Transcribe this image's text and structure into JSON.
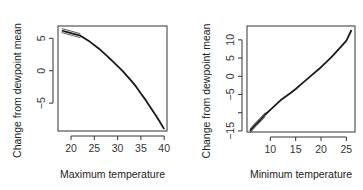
{
  "chart_data": [
    {
      "type": "line",
      "title": "",
      "xlabel": "Maximum temperature",
      "ylabel": "Change from dewpoint mean",
      "xlim": [
        17.2,
        40.6
      ],
      "ylim": [
        -9.3,
        6.9
      ],
      "xticks": [
        20,
        25,
        30,
        35,
        40
      ],
      "yticks": [
        5,
        0,
        -5
      ],
      "grid": false,
      "legend": null,
      "series": [
        {
          "name": "fit",
          "x": [
            18,
            19,
            20,
            22,
            24,
            26,
            28,
            29,
            30,
            31,
            32,
            33,
            34,
            35,
            36,
            37,
            38,
            39,
            40
          ],
          "y": [
            6.2,
            6.0,
            5.8,
            5.4,
            4.5,
            3.4,
            2.1,
            1.4,
            0.7,
            0.0,
            -0.8,
            -1.6,
            -2.5,
            -3.5,
            -4.5,
            -5.6,
            -6.7,
            -7.8,
            -9.0
          ]
        }
      ],
      "box": {
        "left": 58,
        "top": 26,
        "right": 167,
        "bottom": 131
      }
    },
    {
      "type": "line",
      "title": "",
      "xlabel": "Minimum temperature",
      "ylabel": "Change from dewpoint mean",
      "xlim": [
        5.4,
        26.7
      ],
      "ylim": [
        -15.3,
        13.8
      ],
      "xticks": [
        10,
        15,
        20,
        25
      ],
      "yticks": [
        10,
        5,
        0,
        -5,
        -10,
        -15
      ],
      "ytick_labels": [
        "10",
        "5",
        "0",
        "−5",
        "",
        "−15"
      ],
      "grid": false,
      "legend": null,
      "series": [
        {
          "name": "fit",
          "x": [
            6,
            7,
            8,
            9,
            10,
            12,
            14,
            15,
            16,
            18,
            20,
            22,
            24,
            25,
            26
          ],
          "y": [
            -15.0,
            -13.4,
            -12.0,
            -10.5,
            -9.2,
            -6.6,
            -4.6,
            -3.5,
            -2.3,
            0.1,
            2.5,
            5.2,
            8.2,
            9.8,
            12.7
          ]
        }
      ],
      "box": {
        "left": 247,
        "top": 26,
        "right": 355,
        "bottom": 132
      }
    }
  ],
  "panels": [
    {
      "xlabel": "Maximum temperature",
      "ylabel": "Change from dewpoint mean",
      "xtick_labels": [
        "20",
        "25",
        "30",
        "35",
        "40"
      ],
      "ytick_labels": [
        "5",
        "0",
        "−5"
      ]
    },
    {
      "xlabel": "Minimum temperature",
      "ylabel": "Change from dewpoint mean",
      "xtick_labels": [
        "10",
        "15",
        "20",
        "25"
      ],
      "ytick_labels": [
        "10",
        "5",
        "0",
        "−5",
        "",
        "−15"
      ]
    }
  ],
  "colors": {
    "line": "#1a1a1a",
    "axis": "#333333",
    "background": "#ffffff"
  }
}
